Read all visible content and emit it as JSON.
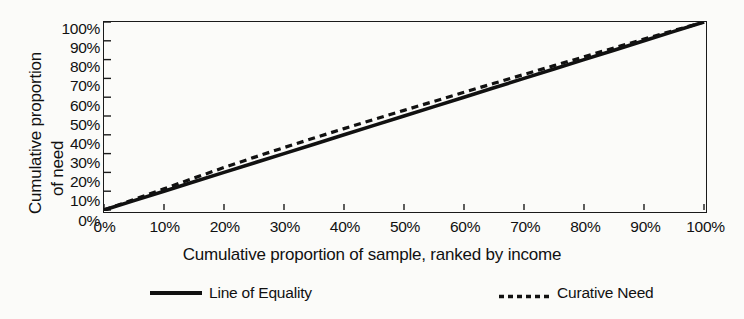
{
  "chart_data": {
    "type": "line",
    "title": "",
    "xlabel": "Cumulative proportion of sample, ranked by income",
    "ylabel_line1": "Cumulative proportion",
    "ylabel_line2": "of need",
    "xlim": [
      0,
      100
    ],
    "ylim": [
      0,
      100
    ],
    "grid": false,
    "legend_position": "bottom",
    "xticks": [
      "0%",
      "10%",
      "20%",
      "30%",
      "40%",
      "50%",
      "60%",
      "70%",
      "80%",
      "90%",
      "100%"
    ],
    "yticks": [
      "100%",
      "90%",
      "80%",
      "70%",
      "60%",
      "50%",
      "40%",
      "30%",
      "20%",
      "10%",
      "0%"
    ],
    "x": [
      0,
      5,
      10,
      15,
      20,
      25,
      30,
      35,
      40,
      45,
      50,
      55,
      60,
      65,
      70,
      75,
      80,
      85,
      90,
      95,
      100
    ],
    "series": [
      {
        "name": "Line of Equality",
        "style": "solid",
        "color": "#111111",
        "values": [
          0,
          5,
          10,
          15,
          20,
          25,
          30,
          35,
          40,
          45,
          50,
          55,
          60,
          65,
          70,
          75,
          80,
          85,
          90,
          95,
          100
        ]
      },
      {
        "name": "Curative Need",
        "style": "dashed",
        "color": "#111111",
        "values": [
          0,
          5.6,
          11.3,
          17.0,
          22.6,
          28.0,
          33.2,
          38.3,
          43.3,
          48.2,
          53.0,
          57.8,
          62.6,
          67.4,
          72.1,
          76.8,
          81.5,
          86.2,
          90.9,
          95.5,
          100
        ]
      }
    ]
  },
  "legend": {
    "items": [
      {
        "label": "Line of Equality",
        "style": "solid"
      },
      {
        "label": "Curative Need",
        "style": "dashed"
      }
    ]
  },
  "colors": {
    "ink": "#111111",
    "background": "#fbfbf9"
  }
}
